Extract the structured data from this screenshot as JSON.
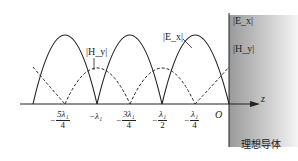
{
  "diagram": {
    "type": "standing-wave-plot",
    "axis_label": "z",
    "origin_label": "O",
    "conductor_label": "理想导体",
    "conductor_legend": [
      "|E_x|",
      "|H_y|"
    ],
    "curve_labels": {
      "E": "|E_x|",
      "H": "|H_y|"
    },
    "tick_labels": [
      {
        "neg": "−",
        "num": "5λ₁",
        "den": "4",
        "x": 65
      },
      {
        "text": "−λ₁",
        "x": 97
      },
      {
        "neg": "−",
        "num": "3λ₁",
        "den": "4",
        "x": 130
      },
      {
        "neg": "−",
        "num": "λ₁",
        "den": "2",
        "x": 162
      },
      {
        "neg": "−",
        "num": "λ₁",
        "den": "4",
        "x": 195
      }
    ],
    "colors": {
      "line": "#222222",
      "conductor_fill_start": "#9a9a9a",
      "conductor_fill_end": "#f2f2f2"
    }
  }
}
